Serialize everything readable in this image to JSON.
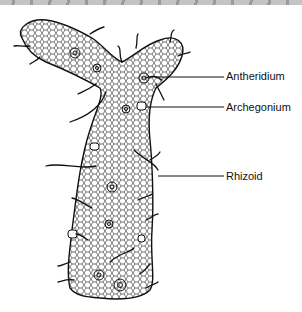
{
  "figure": {
    "labels": [
      {
        "id": "antheridium",
        "text": "Antheridium",
        "x": 226,
        "y": 70
      },
      {
        "id": "archegonium",
        "text": "Archegonium",
        "x": 226,
        "y": 101
      },
      {
        "id": "rhizoid",
        "text": "Rhizoid",
        "x": 226,
        "y": 170
      }
    ]
  }
}
